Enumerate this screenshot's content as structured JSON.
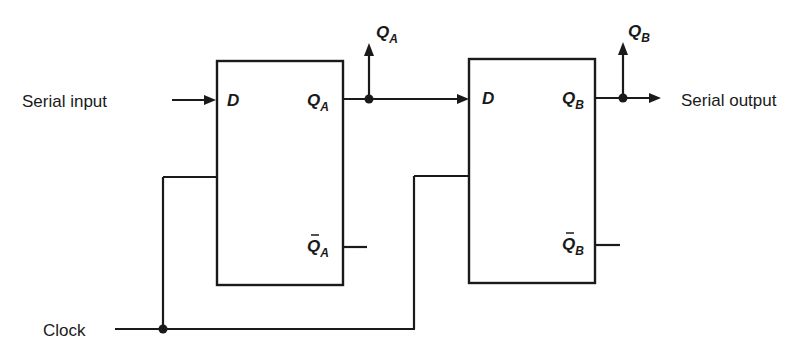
{
  "diagram": {
    "type": "shift-register",
    "labels": {
      "serial_input": "Serial input",
      "serial_output": "Serial output",
      "clock": "Clock"
    },
    "flipflops": [
      {
        "id": "A",
        "d_label": "D",
        "q_label": "Q",
        "q_sub": "A",
        "qbar_label": "Q",
        "qbar_sub": "A",
        "tap_label": "Q",
        "tap_sub": "A"
      },
      {
        "id": "B",
        "d_label": "D",
        "q_label": "Q",
        "q_sub": "B",
        "qbar_label": "Q",
        "qbar_sub": "B",
        "tap_label": "Q",
        "tap_sub": "B"
      }
    ],
    "colors": {
      "line": "#1a1a1a",
      "background": "#ffffff"
    }
  }
}
